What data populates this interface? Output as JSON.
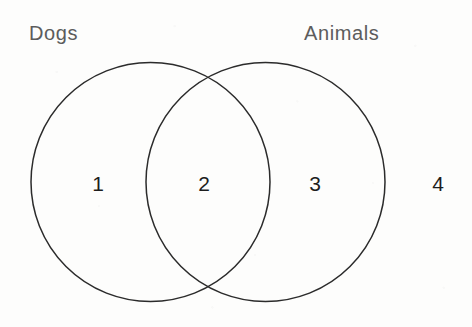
{
  "diagram": {
    "type": "venn-2-set",
    "title": "",
    "background_color": "#fdfdfc",
    "stroke_color": "#2b2b2b",
    "label_color": "#5c5c5c",
    "number_color": "#1d1d1d",
    "sets": [
      {
        "id": "dogs",
        "label": "Dogs",
        "position": "left",
        "center_x": 150,
        "center_y": 182,
        "radius": 120
      },
      {
        "id": "animals",
        "label": "Animals",
        "position": "right",
        "center_x": 266,
        "center_y": 182,
        "radius": 120
      }
    ],
    "regions": [
      {
        "id": "region-1",
        "number": "1",
        "meaning": "dogs-only",
        "center_x": 98,
        "center_y": 183
      },
      {
        "id": "region-2",
        "number": "2",
        "meaning": "dogs-and-animals-intersection",
        "center_x": 204,
        "center_y": 183
      },
      {
        "id": "region-3",
        "number": "3",
        "meaning": "animals-only",
        "center_x": 315,
        "center_y": 183
      },
      {
        "id": "region-4",
        "number": "4",
        "meaning": "outside-both-sets",
        "center_x": 438,
        "center_y": 183
      }
    ]
  }
}
